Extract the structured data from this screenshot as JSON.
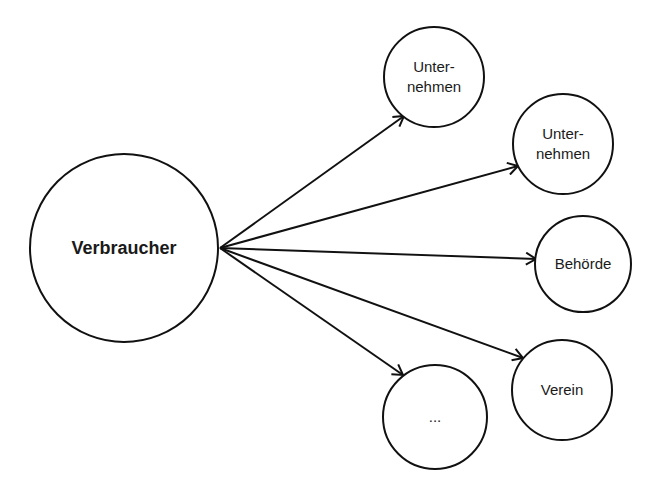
{
  "diagram": {
    "source": {
      "label": "Verbraucher",
      "cx": 124,
      "cy": 248,
      "r": 94,
      "bold": true
    },
    "origin": {
      "x": 220,
      "y": 248
    },
    "targets": [
      {
        "id": "unternehmen-1",
        "lines": [
          "Unter-",
          "nehmen"
        ],
        "cx": 434,
        "cy": 77,
        "r": 50,
        "arrow_end": [
          404,
          116
        ]
      },
      {
        "id": "unternehmen-2",
        "lines": [
          "Unter-",
          "nehmen"
        ],
        "cx": 563,
        "cy": 144,
        "r": 50,
        "arrow_end": [
          518,
          166
        ]
      },
      {
        "id": "behoerde",
        "lines": [
          "Behörde"
        ],
        "cx": 583,
        "cy": 264,
        "r": 48,
        "arrow_end": [
          536,
          259
        ]
      },
      {
        "id": "verein",
        "lines": [
          "Verein"
        ],
        "cx": 562,
        "cy": 390,
        "r": 50,
        "arrow_end": [
          523,
          358
        ]
      },
      {
        "id": "more",
        "lines": [
          "..."
        ],
        "cx": 435,
        "cy": 417,
        "r": 52,
        "arrow_end": [
          403,
          375
        ]
      }
    ],
    "colors": {
      "stroke": "#111111",
      "fill": "#ffffff",
      "text": "#1a1a1a"
    }
  }
}
